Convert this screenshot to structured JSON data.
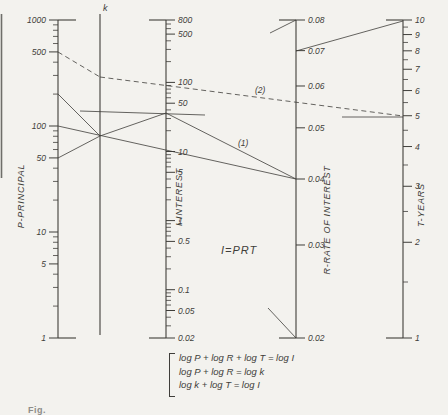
{
  "figure": {
    "center_formula": "I=PRT",
    "equations": [
      "log P + log R + log T = log I",
      "log P + log R = log k",
      "log k + log T = log I"
    ],
    "caption_partial": "Fig.",
    "colors": {
      "paper": "#f3f2ee",
      "ink": "#3f3e3a",
      "edge": "#6f6e6a"
    },
    "page_edge": {
      "x": 1.5,
      "y1": 14,
      "y2": 178
    }
  },
  "chart_data": {
    "type": "nomogram",
    "axes": [
      {
        "name": "P",
        "title": "P-PRINCIPAL",
        "x": 58,
        "y_top": 20,
        "y_bottom": 338,
        "top_value": 1000,
        "bottom_value": 1,
        "scale": "log",
        "tick_side": "left",
        "end_bar_side": "right",
        "labeled_ticks": [
          1000,
          500,
          100,
          50,
          10,
          5,
          1
        ],
        "minor_ticks": [
          900,
          800,
          700,
          600,
          400,
          300,
          200,
          90,
          80,
          70,
          60,
          40,
          30,
          20,
          9,
          8,
          7,
          6,
          4,
          3,
          2
        ],
        "title_x": 24,
        "title_y": 196
      },
      {
        "name": "k",
        "title": "k",
        "x": 100,
        "y_top": 14,
        "y_bottom": 335,
        "scale": "none"
      },
      {
        "name": "I",
        "title": "I-INTEREST",
        "x": 166,
        "y_top": 20,
        "y_bottom": 338,
        "top_value": 800,
        "bottom_value": 0.02,
        "scale": "log",
        "tick_side": "right",
        "end_bar_side": "left",
        "labeled_ticks": [
          800,
          500,
          100,
          50,
          10,
          5,
          1,
          0.5,
          0.1,
          0.05,
          0.02
        ],
        "minor_ticks": [
          700,
          600,
          400,
          300,
          200,
          90,
          80,
          70,
          60,
          40,
          30,
          20,
          9,
          8,
          7,
          6,
          4,
          3,
          2,
          0.9,
          0.8,
          0.7,
          0.6,
          0.4,
          0.3,
          0.2,
          0.09,
          0.08,
          0.07,
          0.06,
          0.04,
          0.03
        ],
        "title_x": 182,
        "title_y": 197
      },
      {
        "name": "R",
        "title": "R-RATE OF INTEREST",
        "x": 296,
        "y_top": 20,
        "y_bottom": 338,
        "top_value": 0.08,
        "bottom_value": 0.02,
        "scale": "log",
        "tick_side": "right",
        "end_bar_side": "left",
        "labeled_ticks": [
          0.08,
          0.07,
          0.06,
          0.05,
          0.04,
          0.03,
          0.02
        ],
        "minor_ticks": [],
        "title_x": 330,
        "title_y": 220
      },
      {
        "name": "T",
        "title": "T-YEARS",
        "x": 403,
        "y_top": 20,
        "y_bottom": 338,
        "top_value": 10,
        "bottom_value": 1,
        "scale": "log",
        "tick_side": "right",
        "end_bar_side": "left",
        "labeled_ticks": [
          10,
          9,
          8,
          7,
          6,
          5,
          4,
          3,
          2,
          1
        ],
        "minor_ticks": [
          9.5,
          8.5,
          7.5,
          6.5,
          5.5,
          4.5,
          3.5,
          2.5,
          1.5
        ],
        "title_x": 424,
        "title_y": 205
      }
    ],
    "index_lines": [
      {
        "id": "example-2-P500-to-k",
        "style": "dashed",
        "x1": 58,
        "y1": 52,
        "x2": 100,
        "y2": 77
      },
      {
        "id": "example-2-k-to-T5",
        "style": "dashed",
        "x1": 100,
        "y1": 77,
        "x2": 403,
        "y2": 116,
        "label": "(2)",
        "label_x": 255,
        "label_y": 93
      },
      {
        "id": "example-1-P100-to-R004",
        "style": "solid",
        "x1": 58,
        "y1": 126,
        "x2": 296,
        "y2": 179
      },
      {
        "id": "example-1-P200-to-k",
        "style": "solid",
        "x1": 58,
        "y1": 94,
        "x2": 100,
        "y2": 136
      },
      {
        "id": "example-1-P50-to-k",
        "style": "solid",
        "x1": 58,
        "y1": 158,
        "x2": 100,
        "y2": 136
      },
      {
        "id": "example-1-k-to-I",
        "style": "solid",
        "x1": 100,
        "y1": 136,
        "x2": 166,
        "y2": 113
      },
      {
        "id": "example-1-I-to-R004",
        "style": "solid",
        "x1": 166,
        "y1": 113,
        "x2": 296,
        "y2": 179,
        "label": "(1)",
        "label_x": 238,
        "label_y": 146
      },
      {
        "id": "reading-marker-I",
        "style": "solid",
        "x1": 80,
        "y1": 111,
        "x2": 205,
        "y2": 115
      },
      {
        "id": "reading-marker-T5",
        "style": "solid",
        "x1": 342,
        "y1": 117,
        "x2": 403,
        "y2": 117
      },
      {
        "id": "line-R007-to-T10",
        "style": "solid",
        "x1": 296,
        "y1": 51,
        "x2": 403,
        "y2": 21
      },
      {
        "id": "line-to-R-top",
        "style": "solid",
        "x1": 270,
        "y1": 33,
        "x2": 296,
        "y2": 20
      },
      {
        "id": "line-to-R-bottom",
        "style": "solid",
        "x1": 268,
        "y1": 308,
        "x2": 296,
        "y2": 338
      }
    ]
  }
}
